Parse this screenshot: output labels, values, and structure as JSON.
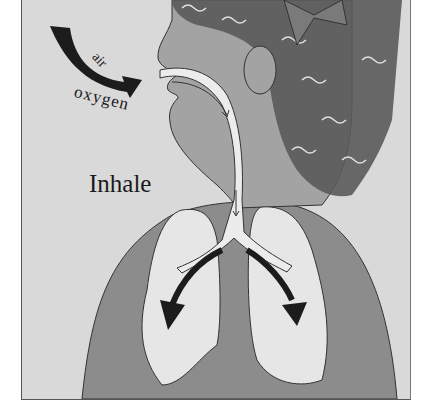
{
  "illustration": {
    "title": "Inhale",
    "labels": {
      "air": "air",
      "oxygen": "oxygen",
      "caption": "Inhale"
    },
    "icons": [
      "air-inflow-arrow",
      "windpipe-flow-arrow",
      "left-lung-arrow",
      "right-lung-arrow"
    ],
    "colors": {
      "background": "#d9d9d9",
      "body": "#8c8c8c",
      "face": "#a3a3a3",
      "lungs": "#e6e6e6",
      "airway": "#ececec",
      "arrow": "#1c1c1c",
      "bow": "#7a7a7a",
      "hair": "#555555"
    }
  }
}
